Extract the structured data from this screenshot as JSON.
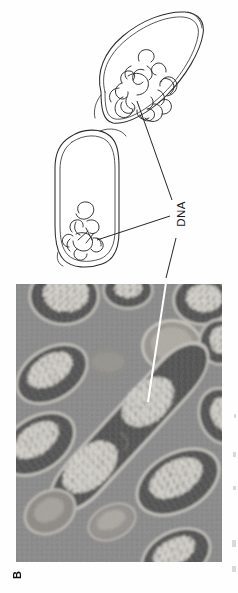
{
  "figure": {
    "panel_letter": "B",
    "width": 238,
    "height": 593,
    "background_color": "#fefefe",
    "orientation_note": "page rotated 90 degrees; labels read bottom-to-top"
  },
  "labels": {
    "dna": "DNA",
    "dna_color": "#15181c"
  },
  "schematic": {
    "name": "bacterial-cell-diagram",
    "description": "Two outlined rod-shaped bacterial cells each containing a tangled DNA nucleoid",
    "line_color": "#2b2b2b",
    "fill_color": "#ffffff",
    "cells": [
      {
        "name": "upper-cell",
        "nucleoid": "tangled-dna-coil"
      },
      {
        "name": "lower-cell",
        "nucleoid": "tangled-dna-coil"
      }
    ],
    "leader_lines": [
      {
        "name": "leader-upper-cell-to-dna-label"
      },
      {
        "name": "leader-lower-cell-to-dna-label"
      },
      {
        "name": "leader-dna-label-to-micrograph"
      }
    ]
  },
  "micrograph": {
    "name": "electron-micrograph",
    "description": "Transmission electron micrograph of dividing bacterial cells with light nucleoid regions",
    "background_color": "#8b8b8b",
    "nucleoid_color": "#e6e4de",
    "cytoplasm_color": "#4a4a4a",
    "membrane_color": "#c9c7c0",
    "pointer_color": "#ffffff",
    "pointer": {
      "name": "white-leader-line",
      "points_to": "nucleoid"
    }
  },
  "colors": {
    "page": "#fefefe",
    "ink": "#2b2b2b",
    "gray_field": "#8b8b8b"
  }
}
